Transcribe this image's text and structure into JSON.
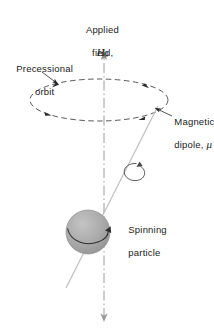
{
  "figure": {
    "background_color": "#ffffff",
    "width": 214,
    "height": 330
  },
  "labels": {
    "applied_field_line1": "Applied",
    "applied_field_line2": "field,",
    "applied_field_symbol": "H",
    "applied_field_subscript": "0",
    "precessional_line1": "Precessional",
    "precessional_line2": "orbit",
    "dipole_line1": "Magnetic",
    "dipole_line2": "dipole, ",
    "dipole_symbol": "μ",
    "particle_line1": "Spinning",
    "particle_line2": "particle"
  },
  "colors": {
    "text": "#1b1b1b",
    "stroke_dark": "#2a2a2a",
    "stroke_light": "#b9b9b9",
    "sphere_fill": "#a9a9a9",
    "sphere_edge": "#8e8e8e",
    "axis": "#9a9a9a"
  },
  "elements": {
    "field_axis": "vertical dash-dot axis with up arrowhead at top and small arrowhead at bottom",
    "precession_orbit": "dashed ellipse with four arrowheads indicating counter-clockwise precession",
    "dipole_vector": "straight light-gray line tilted from lower-left to upper-right through the sphere",
    "spin_arrow": "small circular arrow around the dipole vector indicating particle spin",
    "sphere": "gray shaded sphere representing the spinning particle",
    "sphere_equator_arrow": "curved arrow across the sphere showing spin direction",
    "leader_dipole": "leader line with arrowhead pointing to the dipole vector",
    "leader_precession": "leader line with arrowhead pointing to the dashed orbit"
  },
  "geometry": {
    "axis_x": 104,
    "axis_top_y": 48,
    "axis_bottom_y": 318,
    "ellipse_cx": 99,
    "ellipse_cy": 100,
    "ellipse_rx": 69,
    "ellipse_ry": 21,
    "sphere_cx": 88,
    "sphere_cy": 232,
    "sphere_r": 22
  }
}
